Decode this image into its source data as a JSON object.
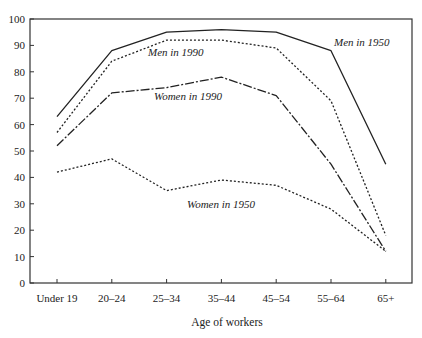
{
  "chart_data": {
    "type": "line",
    "title": "",
    "xlabel": "Age of workers",
    "ylabel": "",
    "ylim": [
      0,
      100
    ],
    "yticks": [
      0,
      10,
      20,
      30,
      40,
      50,
      60,
      70,
      80,
      90,
      100
    ],
    "categories": [
      "Under 19",
      "20–24",
      "25–34",
      "35–44",
      "45–54",
      "55–64",
      "65+"
    ],
    "grid": false,
    "legend": "inline labels",
    "series": [
      {
        "name": "Men in 1950",
        "style": "solid",
        "values": [
          63,
          88,
          95,
          96,
          95,
          88,
          45
        ]
      },
      {
        "name": "Men in 1990",
        "style": "dotted",
        "values": [
          57,
          84,
          92,
          92,
          89,
          69,
          18
        ]
      },
      {
        "name": "Women in 1990",
        "style": "dash-dot",
        "values": [
          52,
          72,
          74,
          78,
          71,
          45,
          12
        ]
      },
      {
        "name": "Women in 1950",
        "style": "dotted",
        "values": [
          42,
          47,
          35,
          39,
          37,
          28,
          12
        ]
      }
    ],
    "annotations": [
      {
        "text": "Men in 1950",
        "x": 334,
        "y": 46
      },
      {
        "text": "Men in 1990",
        "x": 148,
        "y": 56
      },
      {
        "text": "Women in 1990",
        "x": 154,
        "y": 100
      },
      {
        "text": "Women in 1950",
        "x": 187,
        "y": 208
      }
    ]
  }
}
